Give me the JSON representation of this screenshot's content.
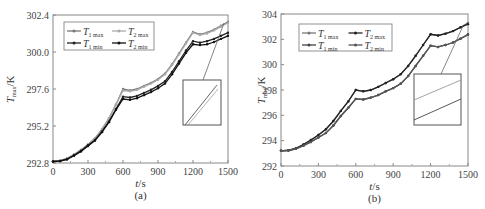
{
  "chart_data": [
    {
      "panel": "(a)",
      "type": "line",
      "xlabel": "t/s",
      "ylabel": "T_max/K",
      "xlim": [
        0,
        1500
      ],
      "ylim": [
        292.8,
        302.4
      ],
      "xticks": [
        0,
        300,
        600,
        900,
        1200,
        1500
      ],
      "yticks": [
        "292.8",
        "295.2",
        "297.6",
        "300.0",
        "302.4"
      ],
      "grid": false,
      "legend_position": "upper-left",
      "legend": [
        "T1 max",
        "T2 max",
        "T1 min",
        "T2 min"
      ],
      "inset": "zoomed view near t=1500 showing two close parallel lines",
      "x": [
        0,
        60,
        120,
        180,
        240,
        300,
        360,
        420,
        480,
        540,
        600,
        660,
        720,
        780,
        840,
        900,
        960,
        1020,
        1080,
        1140,
        1200,
        1260,
        1320,
        1380,
        1440,
        1500
      ],
      "series": [
        {
          "name": "T1 max",
          "color": "#777777",
          "values": [
            292.9,
            292.95,
            293.1,
            293.35,
            293.65,
            294.0,
            294.4,
            295.0,
            295.7,
            296.6,
            297.6,
            297.5,
            297.6,
            297.8,
            298.0,
            298.25,
            298.6,
            299.2,
            299.9,
            300.6,
            301.3,
            301.15,
            301.25,
            301.45,
            301.7,
            301.95
          ]
        },
        {
          "name": "T2 max",
          "color": "#aaaaaa",
          "values": [
            292.9,
            292.95,
            293.1,
            293.35,
            293.65,
            294.0,
            294.4,
            295.0,
            295.7,
            296.6,
            297.5,
            297.45,
            297.55,
            297.75,
            297.95,
            298.2,
            298.55,
            299.15,
            299.85,
            300.55,
            301.25,
            301.1,
            301.2,
            301.4,
            301.65,
            301.9
          ]
        },
        {
          "name": "T1 min",
          "color": "#222222",
          "values": [
            292.9,
            292.93,
            293.05,
            293.3,
            293.6,
            293.95,
            294.3,
            294.85,
            295.5,
            296.3,
            297.1,
            297.05,
            297.15,
            297.35,
            297.55,
            297.8,
            298.1,
            298.7,
            299.4,
            300.1,
            300.7,
            300.6,
            300.7,
            300.85,
            301.05,
            301.25
          ]
        },
        {
          "name": "T2 min",
          "color": "#111111",
          "values": [
            292.9,
            292.92,
            293.03,
            293.27,
            293.55,
            293.9,
            294.25,
            294.8,
            295.45,
            296.25,
            296.95,
            296.9,
            297.0,
            297.2,
            297.4,
            297.65,
            297.95,
            298.55,
            299.25,
            299.95,
            300.5,
            300.45,
            300.5,
            300.65,
            300.85,
            301.05
          ]
        }
      ]
    },
    {
      "panel": "(b)",
      "type": "line",
      "xlabel": "t/s",
      "ylabel": "T_max/K",
      "xlim": [
        0,
        1500
      ],
      "ylim": [
        292,
        304
      ],
      "xticks": [
        0,
        300,
        600,
        900,
        1200,
        1500
      ],
      "yticks": [
        "292",
        "294",
        "296",
        "298",
        "300",
        "302",
        "304"
      ],
      "grid": false,
      "legend_position": "upper-left",
      "legend": [
        "T1 max",
        "T2 max",
        "T1 min",
        "T2 min"
      ],
      "inset": "zoomed view near t=1500 showing two parallel lines",
      "x": [
        0,
        60,
        120,
        180,
        240,
        300,
        360,
        420,
        480,
        540,
        600,
        660,
        720,
        780,
        840,
        900,
        960,
        1020,
        1080,
        1140,
        1200,
        1260,
        1320,
        1380,
        1440,
        1500
      ],
      "series": [
        {
          "name": "T1 max",
          "color": "#777777",
          "values": [
            293.2,
            293.25,
            293.4,
            293.7,
            294.05,
            294.45,
            294.9,
            295.55,
            296.35,
            297.1,
            298.0,
            297.9,
            298.0,
            298.25,
            298.55,
            298.85,
            299.25,
            299.9,
            300.7,
            301.55,
            302.4,
            302.3,
            302.45,
            302.65,
            302.95,
            303.3
          ]
        },
        {
          "name": "T2 max",
          "color": "#222222",
          "values": [
            293.2,
            293.25,
            293.4,
            293.7,
            294.05,
            294.45,
            294.9,
            295.55,
            296.35,
            297.1,
            298.0,
            297.9,
            298.0,
            298.25,
            298.55,
            298.85,
            299.25,
            299.9,
            300.7,
            301.55,
            302.4,
            302.3,
            302.45,
            302.65,
            302.95,
            303.2
          ]
        },
        {
          "name": "T1 min",
          "color": "#444444",
          "values": [
            293.2,
            293.22,
            293.35,
            293.6,
            293.9,
            294.25,
            294.6,
            295.2,
            295.95,
            296.6,
            297.3,
            297.25,
            297.4,
            297.6,
            297.9,
            298.15,
            298.5,
            299.1,
            299.9,
            300.7,
            301.5,
            301.4,
            301.55,
            301.75,
            302.05,
            302.4
          ]
        },
        {
          "name": "T2 min",
          "color": "#555555",
          "values": [
            293.2,
            293.22,
            293.35,
            293.6,
            293.9,
            294.25,
            294.6,
            295.2,
            295.95,
            296.6,
            297.3,
            297.25,
            297.4,
            297.6,
            297.9,
            298.15,
            298.5,
            299.1,
            299.9,
            300.7,
            301.5,
            301.4,
            301.55,
            301.75,
            302.05,
            302.35
          ]
        }
      ]
    }
  ],
  "labels": {
    "panel_a": "(a)",
    "panel_b": "(b)",
    "xlabel": "t/s",
    "ylabel_main": "T",
    "ylabel_sub": "max",
    "ylabel_unit": "/K",
    "legend": [
      {
        "main": "T",
        "sub": "1 max"
      },
      {
        "main": "T",
        "sub": "2 max"
      },
      {
        "main": "T",
        "sub": "1 min"
      },
      {
        "main": "T",
        "sub": "2 min"
      }
    ]
  }
}
